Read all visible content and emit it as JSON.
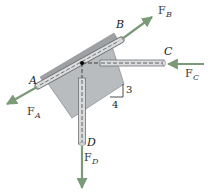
{
  "diagram": {
    "type": "free-body / force diagram",
    "colors": {
      "plate": "#b9bcbf",
      "plate_edge": "#8e9194",
      "rear_strip": "#9ea1a4",
      "rod": "#d9dbdd",
      "rod_edge": "#6f7275",
      "force_arrow": "#7a9a78",
      "junction": "#000000"
    },
    "points": {
      "A": {
        "label": "A"
      },
      "B": {
        "label": "B"
      },
      "C": {
        "label": "C"
      },
      "D": {
        "label": "D"
      }
    },
    "forces": [
      {
        "id": "FA",
        "symbol": "F",
        "subscript": "A",
        "direction": "down-left along rod AB"
      },
      {
        "id": "FB",
        "symbol": "F",
        "subscript": "B",
        "direction": "up-right along rod AB"
      },
      {
        "id": "FC",
        "symbol": "F",
        "subscript": "C",
        "direction": "left, horizontal"
      },
      {
        "id": "FD",
        "symbol": "F",
        "subscript": "D",
        "direction": "down, vertical"
      }
    ],
    "slope": {
      "rise": "3",
      "run": "4"
    }
  }
}
